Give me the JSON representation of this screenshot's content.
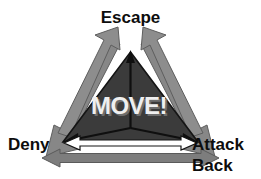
{
  "diagram": {
    "background_color": "#ffffff",
    "center": {
      "label": "MOVE!",
      "text_color": "#efefef",
      "shadow_color": "#6d6d6d",
      "fill_color": "#3b3b3b"
    },
    "vertices": [
      {
        "id": "escape",
        "label": "Escape",
        "position": "top"
      },
      {
        "id": "deny",
        "label": "Deny",
        "position": "bottom-left"
      },
      {
        "id": "attack-back",
        "label": "Attack",
        "label_line2": "Back",
        "position": "bottom-right"
      }
    ],
    "arrows": {
      "color": "#8a8a8a",
      "outline_color": "#5a5a5a",
      "inner_color": "#0d0d0d",
      "white_arrow_fill": "#ffffff",
      "white_arrow_outline": "#151515",
      "count": 6,
      "description": "Gray outward arrows along each triangle edge, white double-headed base arrow, gray double-headed bottom arrow, and thin black arrows radiating from center to each vertex"
    },
    "label_color": "#0d0d0d"
  }
}
